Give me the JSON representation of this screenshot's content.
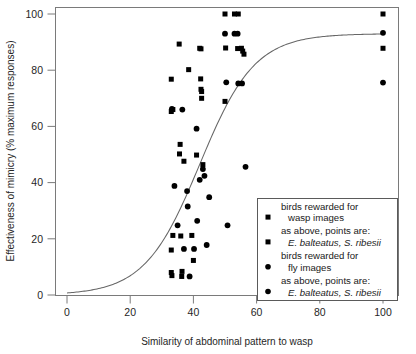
{
  "chart_data": {
    "type": "scatter",
    "title": "",
    "xlabel": "Similarity of abdominal pattern to wasp",
    "ylabel": "Effectiveness of mimicry (% maximum responses)",
    "xlim": [
      -3,
      104
    ],
    "ylim": [
      -4,
      104
    ],
    "xticks": [
      0,
      20,
      40,
      60,
      80,
      100
    ],
    "yticks": [
      0,
      20,
      40,
      60,
      80,
      100
    ],
    "xtick_labels": [
      "0",
      "20",
      "40",
      "60",
      "80",
      "100"
    ],
    "ytick_labels": [
      "0",
      "20",
      "40",
      "60",
      "80",
      "100"
    ],
    "grid": false,
    "legend_position": "lower-right",
    "series": [
      {
        "name": "birds rewarded for wasp images",
        "marker": "square",
        "color": "#000000",
        "points": [
          [
            33.0,
            76.8
          ],
          [
            33.0,
            65.3
          ],
          [
            33.5,
            66.0
          ],
          [
            33.5,
            21.2
          ],
          [
            33.0,
            8.0
          ],
          [
            33.2,
            6.9
          ],
          [
            33.0,
            16.0
          ],
          [
            35.5,
            89.3
          ],
          [
            35.8,
            53.6
          ],
          [
            35.6,
            50.2
          ],
          [
            36.0,
            21.0
          ],
          [
            36.4,
            8.4
          ],
          [
            36.3,
            6.6
          ],
          [
            37.0,
            47.6
          ],
          [
            38.5,
            80.2
          ],
          [
            39.5,
            21.2
          ],
          [
            40.0,
            12.3
          ],
          [
            41.0,
            49.8
          ],
          [
            42.0,
            87.8
          ],
          [
            42.4,
            87.6
          ],
          [
            42.3,
            76.9
          ],
          [
            42.6,
            72.4
          ],
          [
            42.6,
            70.0
          ],
          [
            42.4,
            73.2
          ],
          [
            43.0,
            46.4
          ],
          [
            50.0,
            100.0
          ],
          [
            50.2,
            87.9
          ],
          [
            50.0,
            68.9
          ],
          [
            53.0,
            100.0
          ],
          [
            54.2,
            100.0
          ],
          [
            54.0,
            87.7
          ],
          [
            55.2,
            87.8
          ],
          [
            55.6,
            86.8
          ],
          [
            56.0,
            85.7
          ],
          [
            100.0,
            100.0
          ],
          [
            100.0,
            87.8
          ]
        ]
      },
      {
        "name": "birds rewarded for fly images",
        "marker": "circle",
        "color": "#000000",
        "points": [
          [
            33.2,
            66.2
          ],
          [
            34.0,
            38.8
          ],
          [
            35.0,
            24.8
          ],
          [
            36.5,
            66.0
          ],
          [
            37.0,
            16.4
          ],
          [
            38.0,
            37.0
          ],
          [
            38.2,
            31.5
          ],
          [
            38.8,
            6.6
          ],
          [
            40.2,
            16.4
          ],
          [
            41.0,
            59.2
          ],
          [
            41.2,
            26.4
          ],
          [
            42.0,
            41.0
          ],
          [
            43.0,
            44.8
          ],
          [
            43.5,
            42.4
          ],
          [
            44.2,
            17.8
          ],
          [
            45.0,
            34.8
          ],
          [
            50.0,
            93.0
          ],
          [
            50.4,
            75.7
          ],
          [
            53.0,
            93.0
          ],
          [
            54.0,
            93.0
          ],
          [
            54.2,
            75.3
          ],
          [
            55.4,
            75.3
          ],
          [
            50.8,
            24.8
          ],
          [
            56.5,
            45.6
          ],
          [
            100.0,
            93.3
          ],
          [
            100.0,
            75.6
          ]
        ]
      }
    ],
    "fitted_curve": {
      "name": "logistic fit",
      "color": "#555555",
      "asymptote": 93,
      "midpoint": 42,
      "slope": 0.115
    }
  },
  "legend": {
    "entries": [
      {
        "marker": "square",
        "lines": [
          "birds rewarded for",
          "wasp images"
        ],
        "italic_lines": []
      },
      {
        "marker": "square",
        "lines": [
          "as above, points are:"
        ],
        "italic_lines": [
          "E. balteatus, S. ribesii"
        ]
      },
      {
        "marker": "circle",
        "lines": [
          "birds rewarded for",
          "fly images"
        ],
        "italic_lines": []
      },
      {
        "marker": "circle",
        "lines": [
          "as above, points are:"
        ],
        "italic_lines": [
          "E. balteatus, S. ribesii"
        ]
      }
    ]
  }
}
